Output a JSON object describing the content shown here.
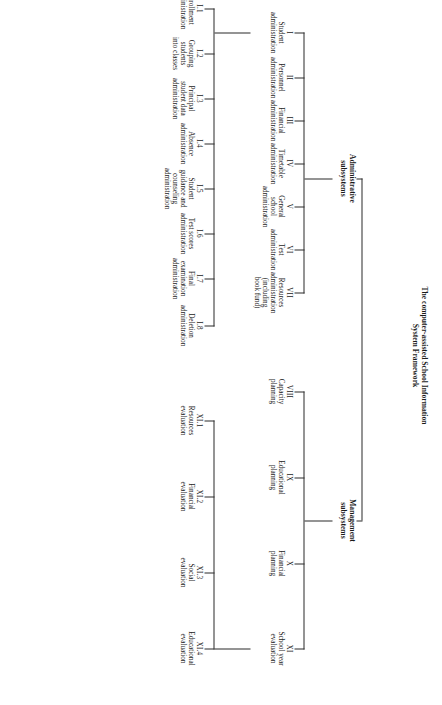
{
  "diagram": {
    "title_line1": "The computer-assisted School Information",
    "title_line2": "System Framework",
    "groups": {
      "administrative": "Administrative\nsubsystems",
      "administrative_l1": "Administrative",
      "administrative_l2": "subsystems",
      "management_l1": "Management",
      "management_l2": "subsystems"
    },
    "administrative_nodes": [
      {
        "code": "I",
        "name": "Student\nadministration",
        "n1": "Student",
        "n2": "administration",
        "n3": "",
        "n4": ""
      },
      {
        "code": "II",
        "name": "Personnel administration",
        "n1": "Personnel",
        "n2": "administration",
        "n3": "",
        "n4": ""
      },
      {
        "code": "III",
        "name": "Financial administration",
        "n1": "Financial",
        "n2": "administration",
        "n3": "",
        "n4": ""
      },
      {
        "code": "IV",
        "name": "Timetable administration",
        "n1": "Timetable",
        "n2": "administration",
        "n3": "",
        "n4": ""
      },
      {
        "code": "V",
        "name": "General school administration",
        "n1": "General",
        "n2": "school",
        "n3": "administration",
        "n4": ""
      },
      {
        "code": "VI",
        "name": "Test administration",
        "n1": "Test",
        "n2": "administration",
        "n3": "",
        "n4": ""
      },
      {
        "code": "VII",
        "name": "Resources administration (including book fund)",
        "n1": "Resources",
        "n2": "administration",
        "n3": "(including",
        "n4": "book fund)"
      }
    ],
    "student_subnodes": [
      {
        "code": "I.1",
        "n1": "Enrollment",
        "n2": "administration",
        "n3": "",
        "n4": ""
      },
      {
        "code": "I.2",
        "n1": "Grouping",
        "n2": "students",
        "n3": "into classes",
        "n4": ""
      },
      {
        "code": "I.3",
        "n1": "Principal",
        "n2": "student data",
        "n3": "administration",
        "n4": ""
      },
      {
        "code": "I.4",
        "n1": "Absence",
        "n2": "administration",
        "n3": "",
        "n4": ""
      },
      {
        "code": "I.5",
        "n1": "Student",
        "n2": "guidance and",
        "n3": "counseling",
        "n4": "administration"
      },
      {
        "code": "I.6",
        "n1": "Test scores",
        "n2": "administration",
        "n3": "",
        "n4": ""
      },
      {
        "code": "I.7",
        "n1": "Final",
        "n2": "examination",
        "n3": "administration",
        "n4": ""
      },
      {
        "code": "I.8",
        "n1": "Deletion",
        "n2": "administration",
        "n3": "",
        "n4": ""
      }
    ],
    "management_nodes": [
      {
        "code": "VIII",
        "n1": "Capacity",
        "n2": "planning",
        "n3": "",
        "n4": ""
      },
      {
        "code": "IX",
        "n1": "Educational",
        "n2": "planning",
        "n3": "",
        "n4": ""
      },
      {
        "code": "X",
        "n1": "Financial",
        "n2": "planning",
        "n3": "",
        "n4": ""
      },
      {
        "code": "XI",
        "n1": "School year",
        "n2": "evaluation",
        "n3": "",
        "n4": ""
      }
    ],
    "evaluation_subnodes": [
      {
        "code": "XI.1",
        "n1": "Resources",
        "n2": "evaluation",
        "n3": "",
        "n4": ""
      },
      {
        "code": "XI.2",
        "n1": "Financial",
        "n2": "evaluation",
        "n3": "",
        "n4": ""
      },
      {
        "code": "XI.3",
        "n1": "Social",
        "n2": "evaluation",
        "n3": "",
        "n4": ""
      },
      {
        "code": "XI.4",
        "n1": "Educational",
        "n2": "evaluation",
        "n3": "",
        "n4": ""
      }
    ],
    "line_color": "#2a2a2a"
  }
}
